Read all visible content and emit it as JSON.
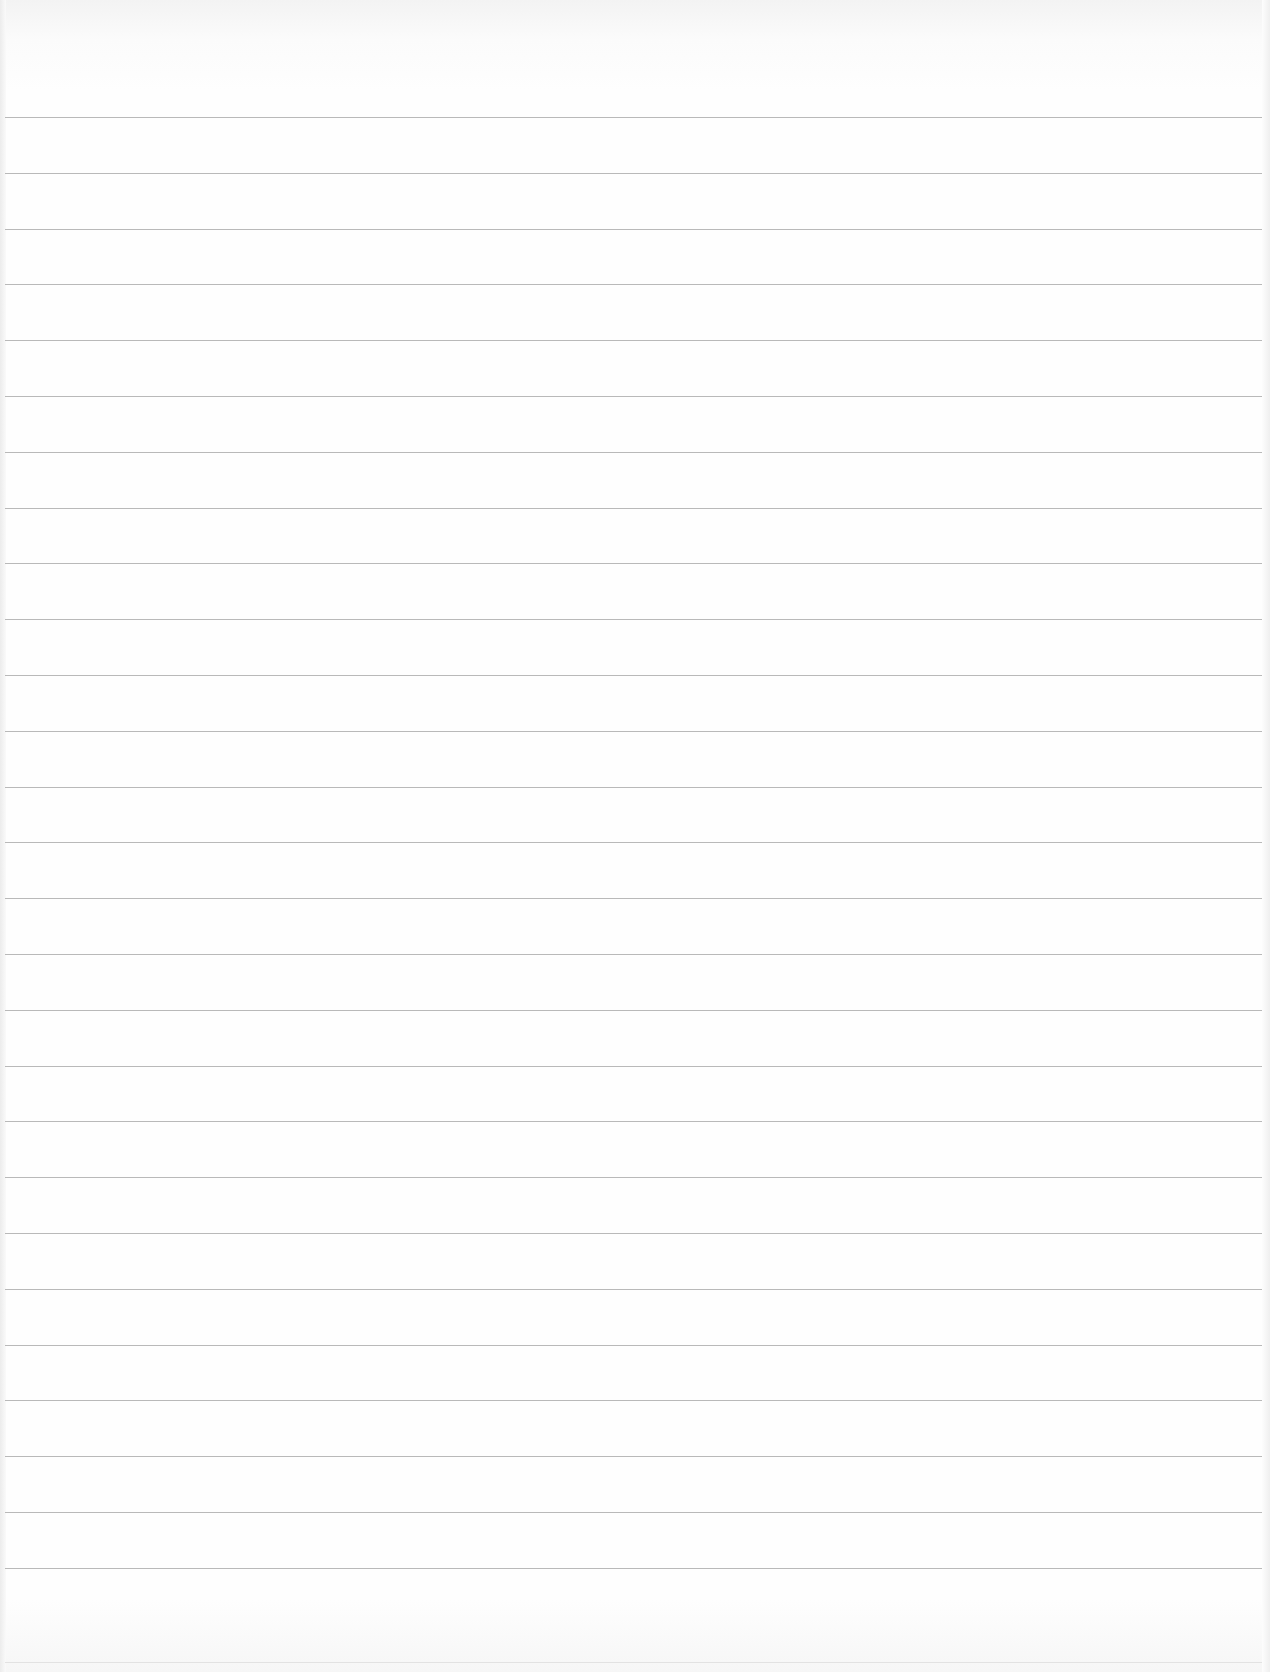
{
  "page": {
    "type": "blank-lined-paper",
    "background_color": "#fefefe",
    "rule_color": "#b9b9b9",
    "first_rule_y": 117,
    "rule_spacing": 55.8,
    "rule_count": 27,
    "rule_left": 5,
    "rule_width": 1257,
    "text": []
  }
}
